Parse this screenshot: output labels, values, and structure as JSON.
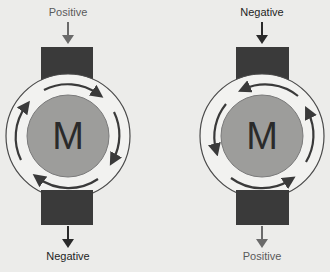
{
  "colors": {
    "background": "#ececea",
    "brush": "#3a3a3a",
    "housing": "#f2f2f0",
    "housing_stroke": "#4a4a4a",
    "rotor": "#9d9d9b",
    "arrow": "#3a3a3a",
    "label_positive": "#5a5a5a",
    "label_negative": "#1e1e1e"
  },
  "motors": [
    {
      "id": "left",
      "center_letter": "M",
      "top_label": "Positive",
      "bottom_label": "Negative",
      "rotation": "clockwise"
    },
    {
      "id": "right",
      "center_letter": "M",
      "top_label": "Negative",
      "bottom_label": "Positive",
      "rotation": "counterclockwise"
    }
  ]
}
